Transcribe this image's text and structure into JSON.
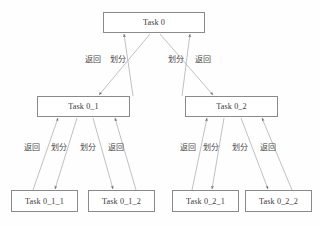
{
  "diagram": {
    "type": "tree",
    "colors": {
      "background": "#fefefe",
      "node_border": "#8a8a8a",
      "node_fill": "#ffffff",
      "node_text": "#3a3a3a",
      "edge_line": "#b0b0b0",
      "edge_label_text": "#4a4a4a"
    },
    "nodes": [
      {
        "id": "task0",
        "label": "Task 0",
        "x": 103,
        "y": 12,
        "w": 102,
        "h": 21
      },
      {
        "id": "task0_1",
        "label": "Task 0_1",
        "x": 37,
        "y": 96,
        "w": 93,
        "h": 21
      },
      {
        "id": "task0_2",
        "label": "Task 0_2",
        "x": 185,
        "y": 96,
        "w": 93,
        "h": 21
      },
      {
        "id": "task0_1_1",
        "label": "Task 0_1_1",
        "x": 11,
        "y": 190,
        "w": 67,
        "h": 22
      },
      {
        "id": "task0_1_2",
        "label": "Task 0_1_2",
        "x": 88,
        "y": 190,
        "w": 67,
        "h": 22
      },
      {
        "id": "task0_2_1",
        "label": "Task 0_2_1",
        "x": 172,
        "y": 190,
        "w": 67,
        "h": 22
      },
      {
        "id": "task0_2_2",
        "label": "Task 0_2_2",
        "x": 245,
        "y": 190,
        "w": 67,
        "h": 22
      }
    ],
    "edges": [
      {
        "id": "e1",
        "from": "task0_1",
        "to": "task0",
        "label": "返回",
        "kind": "return",
        "x1": 133,
        "y1": 96,
        "x2": 124,
        "y2": 34
      },
      {
        "id": "e2",
        "from": "task0",
        "to": "task0_1",
        "label": "划分",
        "kind": "divide",
        "x1": 150,
        "y1": 34,
        "x2": 99,
        "y2": 95
      },
      {
        "id": "e3",
        "from": "task0",
        "to": "task0_2",
        "label": "划分",
        "kind": "divide",
        "x1": 160,
        "y1": 34,
        "x2": 213,
        "y2": 95
      },
      {
        "id": "e4",
        "from": "task0_2",
        "to": "task0",
        "label": "返回",
        "kind": "return",
        "x1": 182,
        "y1": 96,
        "x2": 190,
        "y2": 34
      },
      {
        "id": "e5",
        "from": "task0_1_1",
        "to": "task0_1",
        "label": "返回",
        "kind": "return",
        "x1": 33,
        "y1": 190,
        "x2": 58,
        "y2": 118
      },
      {
        "id": "e6",
        "from": "task0_1",
        "to": "task0_1_1",
        "label": "划分",
        "kind": "divide",
        "x1": 77,
        "y1": 118,
        "x2": 55,
        "y2": 189
      },
      {
        "id": "e7",
        "from": "task0_1_2",
        "to": "task0_1",
        "label": "划分",
        "kind": "divide",
        "x1": 93,
        "y1": 118,
        "x2": 113,
        "y2": 189
      },
      {
        "id": "e8",
        "from": "task0_1",
        "to": "task0_1_2",
        "label": "返回",
        "kind": "return",
        "x1": 136,
        "y1": 190,
        "x2": 115,
        "y2": 118
      },
      {
        "id": "e9",
        "from": "task0_2_1",
        "to": "task0_2",
        "label": "返回",
        "kind": "return",
        "x1": 192,
        "y1": 190,
        "x2": 207,
        "y2": 118
      },
      {
        "id": "e10",
        "from": "task0_2",
        "to": "task0_2_1",
        "label": "划分",
        "kind": "divide",
        "x1": 224,
        "y1": 118,
        "x2": 212,
        "y2": 189
      },
      {
        "id": "e11",
        "from": "task0_2_2",
        "to": "task0_2",
        "label": "划分",
        "kind": "divide",
        "x1": 241,
        "y1": 118,
        "x2": 268,
        "y2": 189
      },
      {
        "id": "e12",
        "from": "task0_2",
        "to": "task0_2_2",
        "label": "返回",
        "kind": "return",
        "x1": 292,
        "y1": 190,
        "x2": 262,
        "y2": 118
      }
    ],
    "edge_labels": [
      {
        "id": "l1",
        "text": "返回",
        "x": 85,
        "y": 53
      },
      {
        "id": "l2",
        "text": "划分",
        "x": 110,
        "y": 53
      },
      {
        "id": "l3",
        "text": "划分",
        "x": 168,
        "y": 53
      },
      {
        "id": "l4",
        "text": "返回",
        "x": 195,
        "y": 53
      },
      {
        "id": "l5",
        "text": "返回",
        "x": 24,
        "y": 141
      },
      {
        "id": "l6",
        "text": "划分",
        "x": 51,
        "y": 141
      },
      {
        "id": "l7",
        "text": "划分",
        "x": 80,
        "y": 141
      },
      {
        "id": "l8",
        "text": "返回",
        "x": 108,
        "y": 141
      },
      {
        "id": "l9",
        "text": "返回",
        "x": 180,
        "y": 141
      },
      {
        "id": "l10",
        "text": "划分",
        "x": 203,
        "y": 141
      },
      {
        "id": "l11",
        "text": "划分",
        "x": 232,
        "y": 141
      },
      {
        "id": "l12",
        "text": "返回",
        "x": 260,
        "y": 141
      }
    ]
  }
}
